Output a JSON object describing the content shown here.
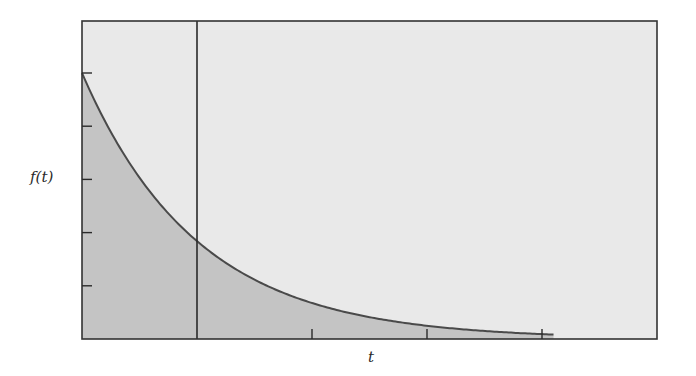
{
  "chart_data": {
    "type": "area",
    "title": "",
    "function": "f(t) = f0 * exp(-t / tau)",
    "xlabel": "t",
    "ylabel": "f(t)",
    "x_ticks": [
      0,
      1,
      2,
      3,
      4
    ],
    "x_tick_labels": [],
    "y_ticks": [
      0.2,
      0.4,
      0.6,
      0.8,
      1.0
    ],
    "y_tick_labels": [],
    "xlim": [
      0,
      5
    ],
    "ylim": [
      0,
      1.2
    ],
    "x": [
      0,
      0.5,
      1,
      1.5,
      2,
      2.5,
      3,
      3.5,
      4,
      4.1
    ],
    "values": [
      1.0,
      0.607,
      0.368,
      0.223,
      0.135,
      0.082,
      0.05,
      0.03,
      0.018,
      0.017
    ],
    "shaded_region": {
      "from": 0,
      "to": 4.1,
      "description": "area under curve"
    },
    "vertical_marker": {
      "x": 1,
      "label": "",
      "value_at_marker": 0.368
    },
    "grid": false,
    "legend": null,
    "colors": {
      "plot_background": "#e9e9e9",
      "area_fill": "#c4c4c4",
      "curve": "#4a4a4a",
      "frame": "#333333",
      "marker_line": "#2a2a2a"
    }
  },
  "labels": {
    "y_axis": "f(t)",
    "x_axis": "t"
  }
}
